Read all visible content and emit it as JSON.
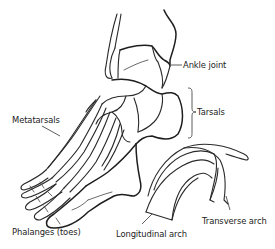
{
  "diagram": {
    "labels": {
      "ankle_joint": "Ankle joint",
      "tarsals": "Tarsals",
      "metatarsals": "Metatarsals",
      "phalanges": "Phalanges (toes)",
      "longitudinal_arch": "Longitudinal arch",
      "transverse_arch": "Transverse arch"
    },
    "colors": {
      "line": "#2a2a2a",
      "background": "#ffffff",
      "text": "#222222"
    }
  }
}
